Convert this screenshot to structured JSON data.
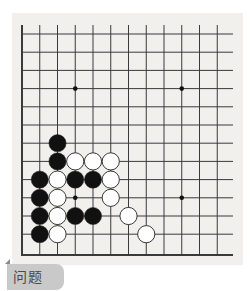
{
  "problem_label": "问题 51",
  "board": {
    "background": "#f1f0ec",
    "line_color": "#3a3a3a",
    "cols": 12,
    "rows": 13,
    "origin_x": 22,
    "origin_y": 34,
    "spacing_x": 17.75,
    "spacing_y": 18.2,
    "left_edge": true,
    "bottom_edge": true,
    "star_points": [
      [
        3,
        3
      ],
      [
        9,
        3
      ],
      [
        3,
        9
      ],
      [
        9,
        9
      ]
    ],
    "stones": [
      {
        "color": "black",
        "col": 2,
        "row": 6
      },
      {
        "color": "black",
        "col": 2,
        "row": 7
      },
      {
        "color": "white",
        "col": 3,
        "row": 7
      },
      {
        "color": "white",
        "col": 4,
        "row": 7
      },
      {
        "color": "white",
        "col": 5,
        "row": 7
      },
      {
        "color": "black",
        "col": 1,
        "row": 8
      },
      {
        "color": "white",
        "col": 2,
        "row": 8
      },
      {
        "color": "black",
        "col": 3,
        "row": 8
      },
      {
        "color": "black",
        "col": 4,
        "row": 8
      },
      {
        "color": "white",
        "col": 5,
        "row": 8
      },
      {
        "color": "black",
        "col": 1,
        "row": 9
      },
      {
        "color": "white",
        "col": 2,
        "row": 9
      },
      {
        "color": "white",
        "col": 5,
        "row": 9
      },
      {
        "color": "black",
        "col": 1,
        "row": 10
      },
      {
        "color": "white",
        "col": 2,
        "row": 10
      },
      {
        "color": "black",
        "col": 3,
        "row": 10
      },
      {
        "color": "black",
        "col": 4,
        "row": 10
      },
      {
        "color": "white",
        "col": 6,
        "row": 10
      },
      {
        "color": "black",
        "col": 1,
        "row": 11
      },
      {
        "color": "white",
        "col": 2,
        "row": 11
      },
      {
        "color": "white",
        "col": 7,
        "row": 11
      }
    ]
  }
}
